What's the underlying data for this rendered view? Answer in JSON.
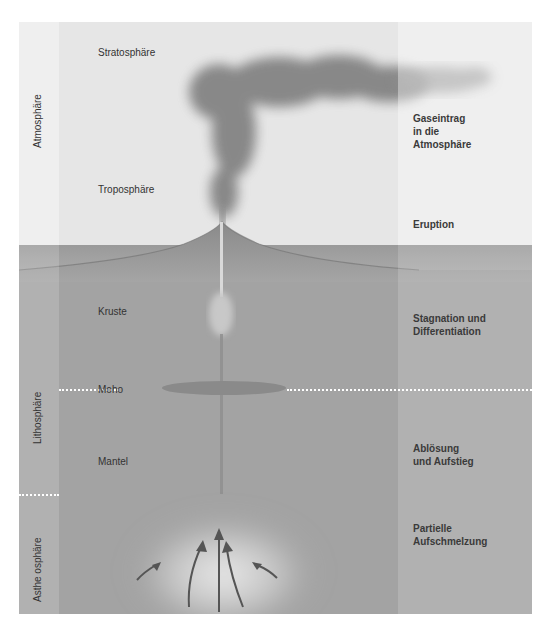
{
  "diagram": {
    "zones_vertical": {
      "atmosphere": "Atmosphäre",
      "lithosphere": "Lithosphäre",
      "asthenosphere": "Asthe osphäre"
    },
    "layers": {
      "stratosphere": "Stratosphäre",
      "troposphere": "Troposphäre",
      "crust": "Kruste",
      "moho": "Moho",
      "mantle": "Mantel"
    },
    "processes": {
      "gas_input": "Gaseintrag\nin die\nAtmosphäre",
      "eruption": "Eruption",
      "stagnation": "Stagnation und\nDifferentiation",
      "detachment": "Ablösung\nund Aufstieg",
      "partial_melting": "Partielle\nAufschmelzung"
    },
    "colors": {
      "atmosphere_bg": "#e6e6e6",
      "earth_bg": "#a3a3a3",
      "plume": "#7a7a7a",
      "arrows": "#555555",
      "dotted_lines": "#ffffff"
    }
  }
}
